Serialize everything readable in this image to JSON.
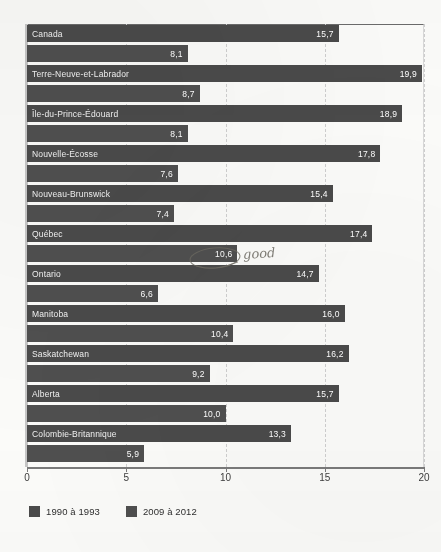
{
  "chart_data": {
    "type": "bar",
    "orientation": "horizontal",
    "title": "",
    "xlabel": "",
    "ylabel": "",
    "xlim": [
      0,
      20
    ],
    "xticks": [
      "0",
      "5",
      "10",
      "15",
      "20"
    ],
    "gridlines": [
      "5",
      "10",
      "15",
      "20"
    ],
    "grid": true,
    "legend_position": "bottom-left",
    "categories": [
      "Canada",
      "Terre-Neuve-et-Labrador",
      "Île-du-Prince-Édouard",
      "Nouvelle-Écosse",
      "Nouveau-Brunswick",
      "Québec",
      "Ontario",
      "Manitoba",
      "Saskatchewan",
      "Alberta",
      "Colombie-Britannique"
    ],
    "series": [
      {
        "name": "1990 à 1993",
        "color": "#4a4a4a",
        "values": [
          15.7,
          19.9,
          18.9,
          17.8,
          15.4,
          17.4,
          14.7,
          16.0,
          16.2,
          15.7,
          13.3
        ],
        "value_labels": [
          "15,7",
          "19,9",
          "18,9",
          "17,8",
          "15,4",
          "17,4",
          "14,7",
          "16,0",
          "16,2",
          "15,7",
          "13,3"
        ]
      },
      {
        "name": "2009 à 2012",
        "color": "#4f4f4f",
        "values": [
          8.1,
          8.7,
          8.1,
          7.6,
          7.4,
          10.6,
          6.6,
          10.4,
          9.2,
          10.0,
          5.9
        ],
        "value_labels": [
          "8,1",
          "8,7",
          "8,1",
          "7,6",
          "7,4",
          "10,6",
          "6,6",
          "10,4",
          "9,2",
          "10,0",
          "5,9"
        ]
      }
    ]
  },
  "legend": {
    "items": [
      {
        "label": "1990 à 1993",
        "color": "#4a4a4a"
      },
      {
        "label": "2009 à 2012",
        "color": "#4f4f4f"
      }
    ]
  },
  "annotation": {
    "handwritten_note": "good",
    "circled_value": "10,6",
    "circled_category": "Québec"
  }
}
